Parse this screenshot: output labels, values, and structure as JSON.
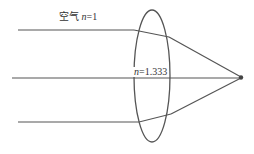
{
  "diagram": {
    "type": "optics-refraction",
    "labels": {
      "air_prefix": "空气",
      "air_var": "n",
      "air_value": "=1",
      "lens_var": "n",
      "lens_value": "=1.333"
    },
    "colors": {
      "line": "#555555",
      "ellipse": "#555555",
      "focus": "#444444",
      "text": "#333333"
    },
    "rays": [
      {
        "name": "top-ray",
        "incident": [
          [
            18,
            30
          ],
          [
            134,
            30
          ]
        ],
        "inside": [
          [
            134,
            30
          ],
          [
            169,
            37
          ]
        ],
        "exit": [
          [
            169,
            37
          ],
          [
            241,
            77
          ]
        ]
      },
      {
        "name": "middle-ray",
        "incident": [
          [
            12,
            78
          ],
          [
            241,
            78
          ]
        ]
      },
      {
        "name": "bottom-ray",
        "incident": [
          [
            18,
            122
          ],
          [
            139,
            122
          ]
        ],
        "inside": [
          [
            139,
            122
          ],
          [
            171,
            114
          ]
        ],
        "exit": [
          [
            171,
            114
          ],
          [
            241,
            78
          ]
        ]
      }
    ],
    "lens": {
      "shape": "ellipse",
      "cx": 152,
      "cy": 76,
      "rx": 18,
      "ry": 66
    },
    "focus_point": {
      "x": 241,
      "y": 77
    }
  }
}
